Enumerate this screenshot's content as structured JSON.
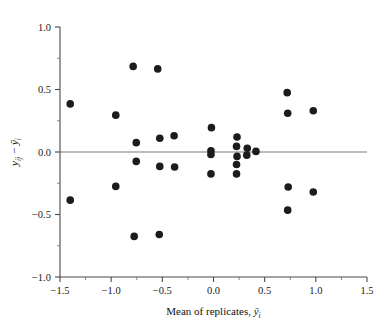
{
  "chart_data": {
    "type": "scatter",
    "title": "",
    "xlabel": "Mean of replicates, ȳi",
    "ylabel": "yij − ȳi",
    "xlim": [
      -1.5,
      1.5
    ],
    "ylim": [
      -1.0,
      1.0
    ],
    "xticks": [
      -1.5,
      -1.0,
      -0.5,
      0.0,
      0.5,
      1.0,
      1.5
    ],
    "xticklabels": [
      "-1.5",
      "-1.0",
      "-0.5",
      "0.0",
      "0.5",
      "1.0",
      "1.5"
    ],
    "yticks": [
      -1.0,
      -0.5,
      0.0,
      0.5,
      1.0
    ],
    "yticklabels": [
      "-1.0",
      "-0.5",
      "0.0",
      "0.5",
      "1.0"
    ],
    "x_minor_tick_step": 0.25,
    "y_minor_tick_step": 0.25,
    "grid": false,
    "legend": null,
    "reference_lines": [
      {
        "name": "zero-residual-line",
        "orientation": "horizontal",
        "y": 0.0,
        "color": "#7a7a7a"
      }
    ],
    "marker": {
      "shape": "circle",
      "color": "#1c1c1c",
      "size": 5.2
    },
    "points": [
      {
        "x": -1.4,
        "y": 0.385
      },
      {
        "x": -1.4,
        "y": -0.385
      },
      {
        "x": -0.955,
        "y": 0.295
      },
      {
        "x": -0.955,
        "y": -0.275
      },
      {
        "x": -0.785,
        "y": 0.685
      },
      {
        "x": -0.755,
        "y": 0.075
      },
      {
        "x": -0.755,
        "y": -0.075
      },
      {
        "x": -0.775,
        "y": -0.675
      },
      {
        "x": -0.545,
        "y": 0.665
      },
      {
        "x": -0.525,
        "y": 0.11
      },
      {
        "x": -0.525,
        "y": -0.115
      },
      {
        "x": -0.53,
        "y": -0.66
      },
      {
        "x": -0.385,
        "y": 0.13
      },
      {
        "x": -0.38,
        "y": -0.12
      },
      {
        "x": -0.02,
        "y": 0.195
      },
      {
        "x": -0.025,
        "y": 0.01
      },
      {
        "x": -0.025,
        "y": -0.02
      },
      {
        "x": -0.025,
        "y": -0.175
      },
      {
        "x": 0.23,
        "y": 0.12
      },
      {
        "x": 0.225,
        "y": 0.045
      },
      {
        "x": 0.23,
        "y": -0.035
      },
      {
        "x": 0.225,
        "y": -0.1
      },
      {
        "x": 0.225,
        "y": -0.175
      },
      {
        "x": 0.33,
        "y": 0.03
      },
      {
        "x": 0.325,
        "y": -0.025
      },
      {
        "x": 0.415,
        "y": 0.005
      },
      {
        "x": 0.72,
        "y": 0.475
      },
      {
        "x": 0.725,
        "y": 0.31
      },
      {
        "x": 0.73,
        "y": -0.28
      },
      {
        "x": 0.725,
        "y": -0.465
      },
      {
        "x": 0.975,
        "y": 0.33
      },
      {
        "x": 0.975,
        "y": -0.32
      }
    ]
  },
  "figure": {
    "xlabel_prefix": "Mean of replicates, ",
    "xlabel_symbol": "y",
    "xlabel_subscript": "i",
    "ylabel_symbol1": "y",
    "ylabel_sub1": "ij",
    "ylabel_minus": "−",
    "ylabel_symbol2": "y",
    "ylabel_sub2": "i"
  }
}
